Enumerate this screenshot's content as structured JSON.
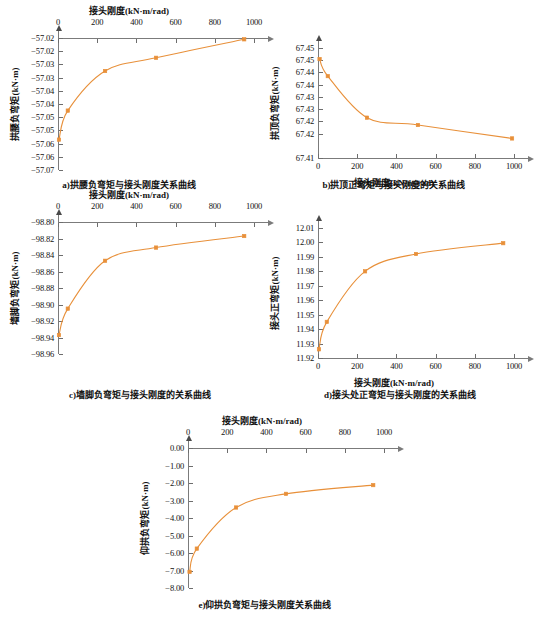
{
  "figure": {
    "accent_color": "#E8903A",
    "axis_color": "#7b7b7b",
    "x_axis_title": "接头刚度(kN·m/rad)",
    "x_ticks": [
      "0",
      "200",
      "400",
      "600",
      "800",
      "1000"
    ]
  },
  "chart_data": [
    {
      "id": "a",
      "type": "line",
      "title": "a)拱腰负弯矩与接头刚度关系曲线",
      "xlabel": "接头刚度(kN·m/rad)",
      "ylabel": "拱腰负弯矩(kN·m)",
      "xlim": [
        0,
        1000
      ],
      "ylim": [
        -57.07,
        -57.02
      ],
      "x_axis_position": "top",
      "grid": false,
      "legend": "none",
      "x": [
        5,
        50,
        240,
        500,
        950
      ],
      "values": [
        -57.0585,
        -57.0475,
        -57.0325,
        -57.0275,
        -57.0205
      ],
      "xticks": [
        "0",
        "200",
        "400",
        "600",
        "800",
        "1000"
      ],
      "yticks": [
        "-57.02",
        "-57.02",
        "-57.03",
        "-57.03",
        "-57.04",
        "-57.04",
        "-57.05",
        "-57.05",
        "-57.06",
        "-57.06",
        "-57.07"
      ],
      "ytick_values": [
        -57.02,
        -57.025,
        -57.03,
        -57.035,
        -57.04,
        -57.045,
        -57.05,
        -57.055,
        -57.06,
        -57.065,
        -57.07
      ]
    },
    {
      "id": "b",
      "type": "line",
      "title": "b)拱顶正弯矩与接头刚度的关系曲线",
      "xlabel": "接头刚度(kN·m/rad)",
      "ylabel": "拱顶负弯矩(kN·m)",
      "xlim": [
        0,
        1000
      ],
      "ylim": [
        67.41,
        67.455
      ],
      "x_axis_position": "bottom",
      "grid": false,
      "legend": "none",
      "x": [
        8,
        50,
        250,
        510,
        990
      ],
      "values": [
        67.4505,
        67.4435,
        67.4265,
        67.4235,
        67.418
      ],
      "xticks": [
        "0",
        "200",
        "400",
        "600",
        "800",
        "1000"
      ],
      "yticks": [
        "67.45",
        "67.45",
        "67.44",
        "67.44",
        "67.43",
        "67.43",
        "67.42",
        "67.42",
        "67.41"
      ],
      "ytick_values": [
        67.455,
        67.45,
        67.445,
        67.44,
        67.435,
        67.43,
        67.425,
        67.42,
        67.41
      ]
    },
    {
      "id": "c",
      "type": "line",
      "title": "c)墙脚负弯矩与接头刚度的关系曲线",
      "xlabel": "接头刚度(kN·m/rad)",
      "ylabel": "墙脚负弯矩(kN·m)",
      "xlim": [
        0,
        1000
      ],
      "ylim": [
        -98.96,
        -98.8
      ],
      "x_axis_position": "top",
      "grid": false,
      "legend": "none",
      "x": [
        5,
        50,
        240,
        500,
        950
      ],
      "values": [
        -98.937,
        -98.905,
        -98.847,
        -98.831,
        -98.817
      ],
      "xticks": [
        "0",
        "200",
        "400",
        "600",
        "800",
        "1000"
      ],
      "yticks": [
        "-98.80",
        "-98.82",
        "-98.84",
        "-98.86",
        "-98.88",
        "-98.90",
        "-98.92",
        "-98.94",
        "-98.96"
      ],
      "ytick_values": [
        -98.8,
        -98.82,
        -98.84,
        -98.86,
        -98.88,
        -98.9,
        -98.92,
        -98.94,
        -98.96
      ]
    },
    {
      "id": "d",
      "type": "line",
      "title": "d)接头处正弯矩与接头刚度的关系曲线",
      "xlabel": "接头刚度(kN·m/rad)",
      "ylabel": "接头正弯矩(kN·m)",
      "xlim": [
        0,
        1000
      ],
      "ylim": [
        11.92,
        12.01
      ],
      "x_axis_position": "bottom",
      "grid": false,
      "legend": "none",
      "x": [
        5,
        45,
        240,
        500,
        945
      ],
      "values": [
        11.926,
        11.945,
        11.98,
        11.992,
        11.9995
      ],
      "xticks": [
        "0",
        "200",
        "400",
        "600",
        "800",
        "1000"
      ],
      "yticks": [
        "12.01",
        "12.00",
        "11.99",
        "11.98",
        "11.97",
        "11.96",
        "11.95",
        "11.94",
        "11.93",
        "11.92"
      ],
      "ytick_values": [
        12.01,
        12.0,
        11.99,
        11.98,
        11.97,
        11.96,
        11.95,
        11.94,
        11.93,
        11.92
      ]
    },
    {
      "id": "e",
      "type": "line",
      "title": "e)仰拱负弯矩与接头刚度关系曲线",
      "xlabel": "接头刚度(kN·m/rad)",
      "ylabel": "仰拱负弯矩(kN·m)",
      "xlim": [
        0,
        1000
      ],
      "ylim": [
        -8.0,
        0.0
      ],
      "x_axis_position": "top",
      "grid": false,
      "legend": "none",
      "x": [
        8,
        45,
        245,
        500,
        945
      ],
      "values": [
        -7.08,
        -5.75,
        -3.4,
        -2.62,
        -2.12
      ],
      "xticks": [
        "0",
        "200",
        "400",
        "600",
        "800",
        "1000"
      ],
      "yticks": [
        "0.00",
        "-1.00",
        "-2.00",
        "-3.00",
        "-4.00",
        "-5.00",
        "-6.00",
        "-7.00",
        "-8.00"
      ],
      "ytick_values": [
        0.0,
        -1.0,
        -2.0,
        -3.0,
        -4.0,
        -5.0,
        -6.0,
        -7.0,
        -8.0
      ]
    }
  ]
}
